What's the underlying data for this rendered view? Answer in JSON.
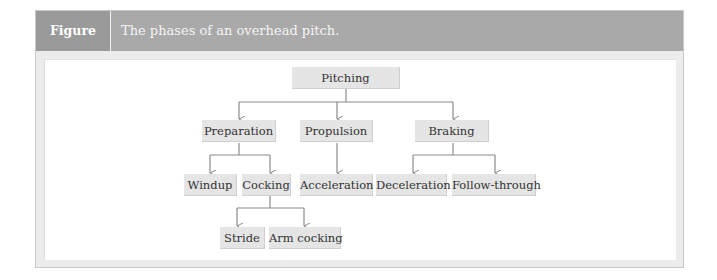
{
  "figure": {
    "label": "Figure 17.40",
    "title": "The phases of an overhead pitch."
  },
  "diagram": {
    "root": "Pitching",
    "level1": [
      "Preparation",
      "Propulsion",
      "Braking"
    ],
    "level2": {
      "preparation": [
        "Windup",
        "Cocking"
      ],
      "propulsion": [
        "Acceleration"
      ],
      "braking": [
        "Deceleration",
        "Follow-through"
      ]
    },
    "level3": {
      "cocking": [
        "Stride",
        "Arm cocking"
      ]
    }
  },
  "colors": {
    "header": "#a9a9a9",
    "label_bg": "#9a9a9a",
    "node_fill": "#e5e5e5",
    "connector": "#8a8a8a"
  }
}
